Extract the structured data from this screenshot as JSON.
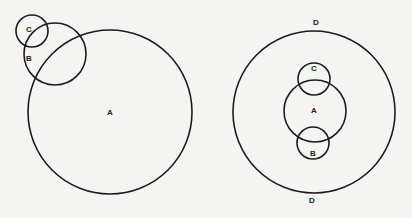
{
  "diagrams": [
    {
      "name": "left",
      "circles": [
        {
          "id": "A",
          "cx": 110,
          "cy": 112,
          "r": 82
        },
        {
          "id": "B",
          "cx": 55,
          "cy": 54,
          "r": 31
        },
        {
          "id": "C",
          "cx": 32,
          "cy": 31,
          "r": 16
        }
      ],
      "labels": [
        {
          "text": "C",
          "x": 29,
          "y": 30
        },
        {
          "text": "B",
          "x": 29,
          "y": 59
        },
        {
          "text": "A",
          "x": 110,
          "y": 113
        }
      ]
    },
    {
      "name": "right",
      "circles": [
        {
          "id": "D",
          "cx": 314,
          "cy": 112,
          "r": 81
        },
        {
          "id": "A",
          "cx": 315,
          "cy": 111,
          "r": 31
        },
        {
          "id": "C",
          "cx": 314,
          "cy": 79,
          "r": 16
        },
        {
          "id": "B",
          "cx": 313,
          "cy": 143,
          "r": 16
        }
      ],
      "labels": [
        {
          "text": "D",
          "x": 316,
          "y": 23
        },
        {
          "text": "C",
          "x": 314,
          "y": 69
        },
        {
          "text": "A",
          "x": 314,
          "y": 111
        },
        {
          "text": "B",
          "x": 313,
          "y": 154
        },
        {
          "text": "D",
          "x": 312,
          "y": 201
        }
      ]
    }
  ]
}
